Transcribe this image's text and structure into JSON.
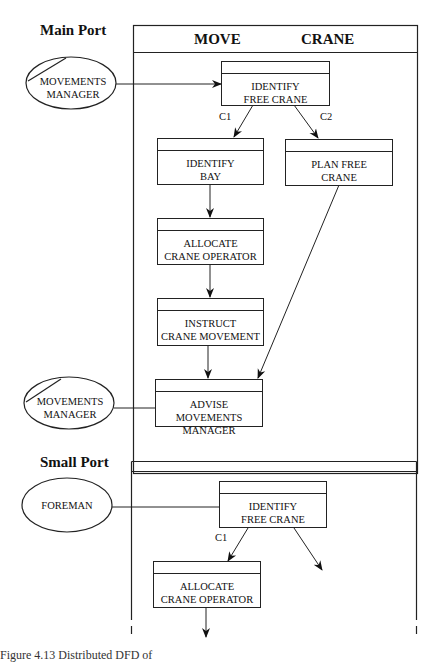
{
  "sections": {
    "main": {
      "label": "Main Port",
      "header": {
        "left": "MOVE",
        "right": "CRANE"
      },
      "external_entities": [
        {
          "line1": "MOVEMENTS",
          "line2": "MANAGER"
        },
        {
          "line1": "MOVEMENTS",
          "line2": "MANAGER"
        }
      ],
      "processes": [
        {
          "line1": "IDENTIFY",
          "line2": "FREE CRANE"
        },
        {
          "line1": "IDENTIFY",
          "line2": "BAY"
        },
        {
          "line1": "PLAN FREE",
          "line2": "CRANE"
        },
        {
          "line1": "ALLOCATE",
          "line2": "CRANE OPERATOR"
        },
        {
          "line1": "INSTRUCT",
          "line2": "CRANE MOVEMENT"
        },
        {
          "line1": "ADVISE MOVEMENTS",
          "line2": "MANAGER"
        }
      ],
      "conditions": {
        "c1": "C1",
        "c2": "C2"
      }
    },
    "small": {
      "label": "Small Port",
      "external_entities": [
        {
          "line1": "FOREMAN"
        }
      ],
      "processes": [
        {
          "line1": "IDENTIFY",
          "line2": "FREE CRANE"
        },
        {
          "line1": "ALLOCATE",
          "line2": "CRANE OPERATOR"
        }
      ],
      "conditions": {
        "c1": "C1"
      }
    }
  },
  "caption": "Figure 4.13  Distributed DFD of"
}
